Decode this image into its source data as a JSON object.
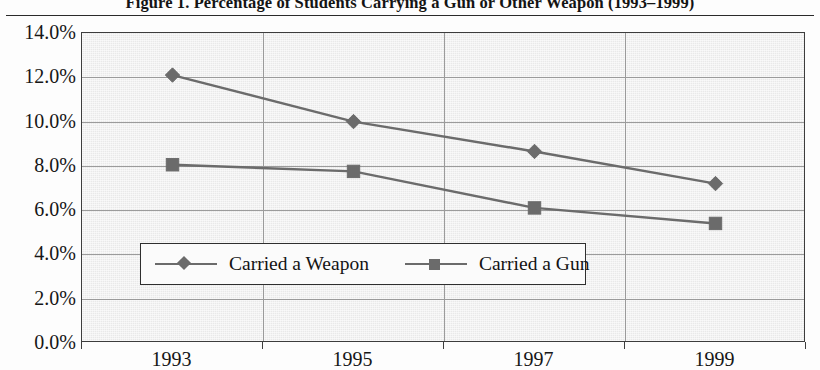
{
  "figure": {
    "title": "Figure 1.  Percentage of Students Carrying a Gun or Other Weapon (1993–1999)"
  },
  "chart_data": {
    "type": "line",
    "title": "Figure 1.  Percentage of Students Carrying a Gun or Other Weapon (1993–1999)",
    "xlabel": "",
    "ylabel": "",
    "categories": [
      "1993",
      "1995",
      "1997",
      "1999"
    ],
    "series": [
      {
        "name": "Carried a Weapon",
        "marker": "diamond",
        "color": "#6b6b6b",
        "values": [
          12.1,
          10.0,
          8.65,
          7.2
        ]
      },
      {
        "name": "Carried a Gun",
        "marker": "square",
        "color": "#6b6b6b",
        "values": [
          8.05,
          7.75,
          6.1,
          5.4
        ]
      }
    ],
    "ylim": [
      0.0,
      14.0
    ],
    "ytick_values": [
      0.0,
      2.0,
      4.0,
      6.0,
      8.0,
      10.0,
      12.0,
      14.0
    ],
    "ytick_labels": [
      "0.0%",
      "2.0%",
      "4.0%",
      "6.0%",
      "8.0%",
      "10.0%",
      "12.0%",
      "14.0%"
    ],
    "grid": true,
    "legend_position": "inside-bottom-center",
    "legend": [
      "Carried a Weapon",
      "Carried a Gun"
    ]
  }
}
